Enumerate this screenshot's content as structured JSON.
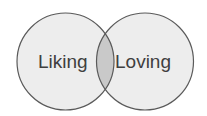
{
  "diagram": {
    "type": "venn",
    "sets": [
      {
        "label": "Liking",
        "fill": "#ededed"
      },
      {
        "label": "Loving",
        "fill": "#ededed"
      }
    ],
    "intersection": {
      "fill": "#c9c9c9"
    },
    "stroke": "#5a5a5a"
  }
}
